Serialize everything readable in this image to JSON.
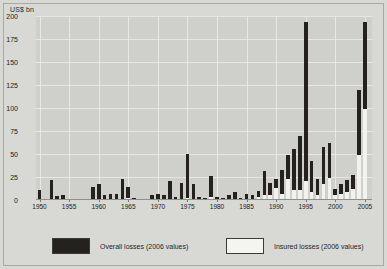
{
  "chart_data": {
    "type": "bar",
    "title": "",
    "subtitle": "",
    "xlabel": "",
    "ylabel": "US$ bn",
    "ylim": [
      0,
      200
    ],
    "yticks": [
      0,
      25,
      50,
      75,
      100,
      125,
      150,
      175,
      200
    ],
    "ytick_labels": [
      "0",
      "25",
      "50",
      "75",
      "100",
      "125",
      "150",
      "175",
      "200"
    ],
    "xlim": [
      1949.4,
      2006.2
    ],
    "xticks": [
      1950,
      1955,
      1960,
      1965,
      1970,
      1975,
      1980,
      1985,
      1990,
      1995,
      2000,
      2005
    ],
    "xtick_labels": [
      "1950",
      "1955",
      "1960",
      "1965",
      "1970",
      "1975",
      "1980",
      "1985",
      "1990",
      "1995",
      "2000",
      "2005"
    ],
    "grid": true,
    "legend_position": "bottom",
    "stacked": true,
    "colors": {
      "overall": "#24211f",
      "insured": "#f2f2ee",
      "panel": "#cfcfcb",
      "background": "#d8d8d4",
      "grid": "#e6e6e2"
    },
    "categories": [
      1950,
      1951,
      1952,
      1953,
      1954,
      1955,
      1956,
      1957,
      1958,
      1959,
      1960,
      1961,
      1962,
      1963,
      1964,
      1965,
      1966,
      1967,
      1968,
      1969,
      1970,
      1971,
      1972,
      1973,
      1974,
      1975,
      1976,
      1977,
      1978,
      1979,
      1980,
      1981,
      1982,
      1983,
      1984,
      1985,
      1986,
      1987,
      1988,
      1989,
      1990,
      1991,
      1992,
      1993,
      1994,
      1995,
      1996,
      1997,
      1998,
      1999,
      2000,
      2001,
      2002,
      2003,
      2004,
      2005
    ],
    "series": [
      {
        "name": "Overall losses (2006 values)",
        "values": [
          11,
          0,
          22,
          4,
          5,
          0,
          0,
          0,
          1,
          14,
          17,
          5,
          7,
          7,
          23,
          14,
          2,
          0,
          1,
          5,
          6,
          5,
          21,
          3,
          19,
          50,
          17,
          3,
          2,
          26,
          3,
          2,
          5,
          9,
          2,
          6,
          5,
          10,
          32,
          18,
          23,
          33,
          49,
          55,
          70,
          193,
          42,
          23,
          58,
          62,
          12,
          17,
          22,
          27,
          120,
          193
        ]
      },
      {
        "name": "Insured losses (2006 values)",
        "values": [
          0,
          0,
          0,
          1,
          2,
          0,
          0,
          0,
          0,
          0,
          1,
          0,
          2,
          2,
          1,
          3,
          0,
          0,
          0,
          1,
          1,
          1,
          2,
          0,
          1,
          3,
          1,
          0,
          0,
          4,
          1,
          0,
          1,
          2,
          1,
          2,
          1,
          4,
          7,
          7,
          14,
          8,
          24,
          12,
          12,
          22,
          10,
          6,
          18,
          25,
          6,
          8,
          10,
          13,
          50,
          100
        ]
      }
    ]
  },
  "legend": {
    "overall_label": "Overall losses (2006 values)",
    "insured_label": "Insured losses (2006 values)"
  }
}
